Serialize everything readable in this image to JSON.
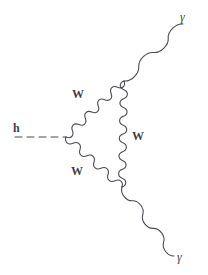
{
  "diagram": {
    "background_color": "#ffffff",
    "line_color": "#4a4a52",
    "label_color": "#3f3f46",
    "width": 208,
    "height": 275,
    "vertices": {
      "higgs_vertex": {
        "x": 66,
        "y": 137
      },
      "top_vertex": {
        "x": 124,
        "y": 81
      },
      "bottom_vertex": {
        "x": 122,
        "y": 187
      }
    },
    "propagators": [
      {
        "name": "higgs-line",
        "particle": "h",
        "style": "dashed",
        "from": {
          "x": 15,
          "y": 137
        },
        "to": {
          "x": 66,
          "y": 137
        }
      },
      {
        "name": "w-upper-left",
        "particle": "W",
        "style": "wavy",
        "from": {
          "x": 66,
          "y": 137
        },
        "to": {
          "x": 124,
          "y": 81
        }
      },
      {
        "name": "w-lower-left",
        "particle": "W",
        "style": "wavy",
        "from": {
          "x": 66,
          "y": 137
        },
        "to": {
          "x": 122,
          "y": 187
        }
      },
      {
        "name": "w-vertical",
        "particle": "W",
        "style": "wavy",
        "from": {
          "x": 124,
          "y": 81
        },
        "to": {
          "x": 122,
          "y": 187
        }
      },
      {
        "name": "photon-upper",
        "particle": "gamma",
        "style": "wavy",
        "from": {
          "x": 124,
          "y": 81
        },
        "to": {
          "x": 183,
          "y": 24
        }
      },
      {
        "name": "photon-lower",
        "particle": "gamma",
        "style": "wavy",
        "from": {
          "x": 122,
          "y": 187
        },
        "to": {
          "x": 174,
          "y": 256
        }
      }
    ],
    "labels": {
      "higgs": {
        "text": "h",
        "x": 13,
        "y": 122
      },
      "w_upper_left": {
        "text": "W",
        "x": 72,
        "y": 88
      },
      "w_lower_left": {
        "text": "W",
        "x": 71,
        "y": 165
      },
      "w_vertical": {
        "text": "W",
        "x": 132,
        "y": 130
      },
      "photon_upper": {
        "text": "γ",
        "x": 180,
        "y": 11
      },
      "photon_lower": {
        "text": "γ",
        "x": 177,
        "y": 251
      }
    }
  }
}
